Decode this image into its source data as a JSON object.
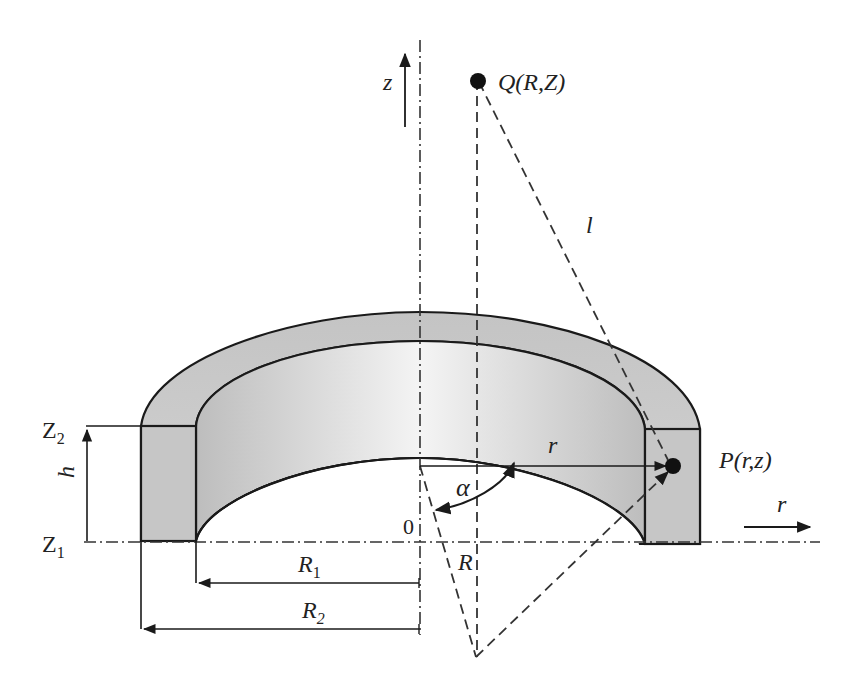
{
  "figure": {
    "colors": {
      "stroke": "#1a1a1a",
      "ring_fill": "#c8c8c8",
      "inner_light": "#f2f2f2",
      "background": "#ffffff"
    }
  },
  "labels": {
    "z_axis": "z",
    "r_axis": "r",
    "point_q": "Q(R,Z)",
    "point_p": "P(r,z)",
    "distance_l": "l",
    "radius_r": "r",
    "angle_alpha": "α",
    "origin": "0",
    "source_radius": "R",
    "inner_radius": "R",
    "inner_radius_sub": "1",
    "outer_radius": "R",
    "outer_radius_sub": "2",
    "height": "h",
    "z_top": "Z",
    "z_top_sub": "2",
    "z_bottom": "Z",
    "z_bottom_sub": "1"
  }
}
